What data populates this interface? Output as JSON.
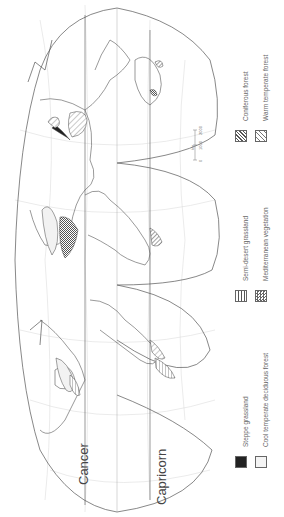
{
  "map": {
    "projection": "interrupted world projection (rotated 90°)",
    "tropics": {
      "cancer_label": "Cancer",
      "capricorn_label": "Capricorn"
    },
    "longitude_labels": [
      "180",
      "160",
      "140",
      "120",
      "100",
      "80",
      "60",
      "40",
      "20",
      "0",
      "20",
      "40",
      "60",
      "80",
      "100",
      "120",
      "140",
      "160",
      "180"
    ],
    "latitude_labels": [
      "80",
      "60",
      "40",
      "20",
      "20",
      "40",
      "60"
    ],
    "scale_bar": {
      "unit": "km",
      "ticks": [
        "0",
        "1000",
        "2000"
      ]
    },
    "colors": {
      "outline": "#444444",
      "graticule": "#bbbbbb",
      "steppe": "#222222"
    }
  },
  "legend": {
    "items": [
      {
        "key": "steppe",
        "label": "Steppe grassland"
      },
      {
        "key": "cool",
        "label": "Cool temperate deciduous forest"
      },
      {
        "key": "semi",
        "label": "Semi-desert grassland"
      },
      {
        "key": "med",
        "label": "Mediterranean vegetation"
      },
      {
        "key": "conif",
        "label": "Coniferous forest"
      },
      {
        "key": "warm",
        "label": "Warm temperate forest"
      }
    ]
  }
}
